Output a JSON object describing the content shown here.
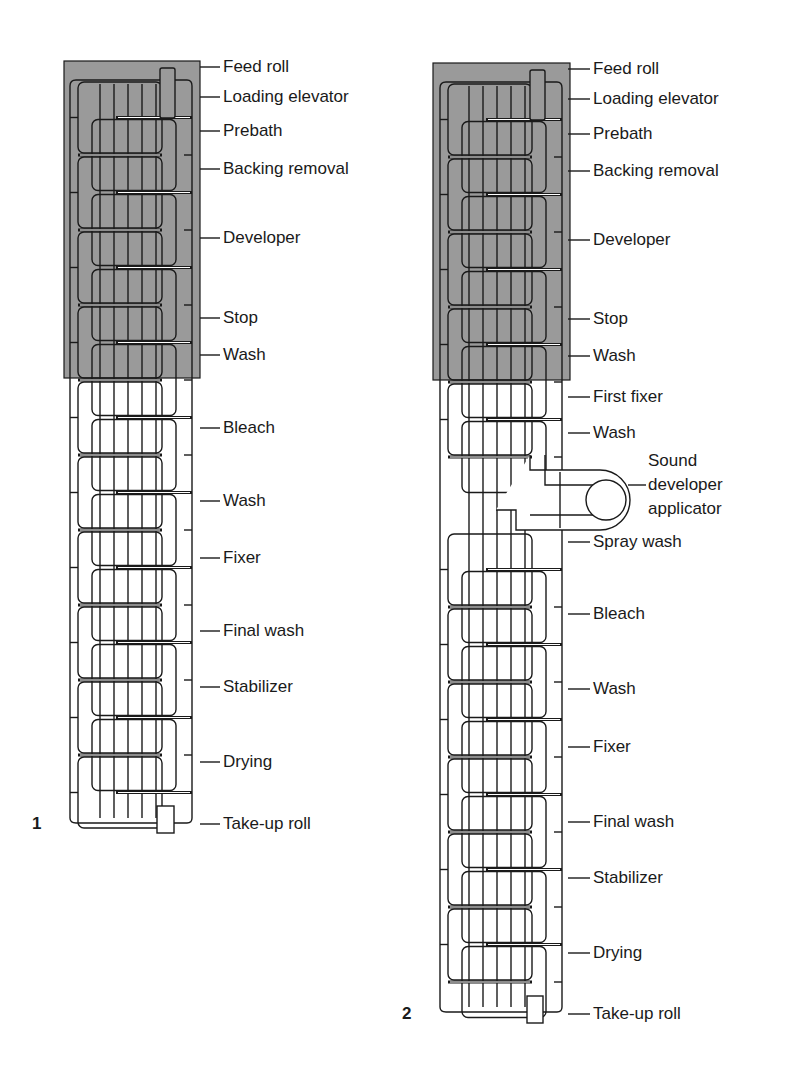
{
  "colors": {
    "ink": "#1a1a1a",
    "darkroom_fill": "#9a9a9a",
    "background": "#ffffff"
  },
  "diagrams": [
    {
      "figure_number": "1",
      "labels": [
        {
          "text": "Feed roll",
          "y": 72
        },
        {
          "text": "Loading elevator",
          "y": 102
        },
        {
          "text": "Prebath",
          "y": 136
        },
        {
          "text": "Backing removal",
          "y": 174
        },
        {
          "text": "Developer",
          "y": 243
        },
        {
          "text": "Stop",
          "y": 323
        },
        {
          "text": "Wash",
          "y": 360
        },
        {
          "text": "Bleach",
          "y": 433
        },
        {
          "text": "Wash",
          "y": 506
        },
        {
          "text": "Fixer",
          "y": 563
        },
        {
          "text": "Final wash",
          "y": 636
        },
        {
          "text": "Stabilizer",
          "y": 692
        },
        {
          "text": "Drying",
          "y": 767
        },
        {
          "text": "Take-up roll",
          "y": 829
        }
      ]
    },
    {
      "figure_number": "2",
      "labels": [
        {
          "text": "Feed roll",
          "y": 74
        },
        {
          "text": "Loading elevator",
          "y": 104
        },
        {
          "text": "Prebath",
          "y": 139
        },
        {
          "text": "Backing removal",
          "y": 176
        },
        {
          "text": "Developer",
          "y": 245
        },
        {
          "text": "Stop",
          "y": 324
        },
        {
          "text": "Wash",
          "y": 361
        },
        {
          "text": "First fixer",
          "y": 402
        },
        {
          "text": "Wash",
          "y": 438
        },
        {
          "text": "Sound",
          "y": 466
        },
        {
          "text": "developer",
          "y": 490
        },
        {
          "text": "applicator",
          "y": 514
        },
        {
          "text": "Spray wash",
          "y": 547
        },
        {
          "text": "Bleach",
          "y": 619
        },
        {
          "text": "Wash",
          "y": 694
        },
        {
          "text": "Fixer",
          "y": 752
        },
        {
          "text": "Final wash",
          "y": 827
        },
        {
          "text": "Stabilizer",
          "y": 883
        },
        {
          "text": "Drying",
          "y": 958
        },
        {
          "text": "Take-up roll",
          "y": 1019
        }
      ]
    }
  ]
}
